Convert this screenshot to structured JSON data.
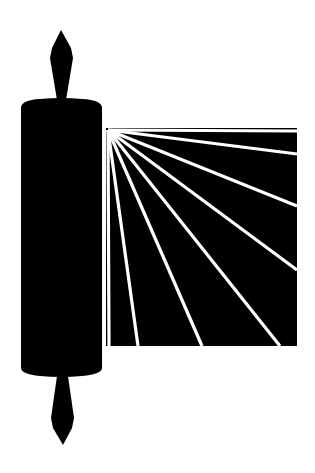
{
  "image": {
    "title": "Scroll icon",
    "subject": "scroll-with-rays",
    "background": "#ffffff",
    "foreground": "#000000",
    "ray_color": "#ffffff"
  },
  "scroll": {
    "roller": {
      "x": 21,
      "y": 100,
      "width": 81,
      "height": 275
    },
    "sheet": {
      "x": 106,
      "y": 128,
      "right": 297,
      "bottom": 346
    },
    "ray_origin": [
      108,
      130
    ],
    "ray_endpoints": [
      [
        297,
        131
      ],
      [
        297,
        154
      ],
      [
        297,
        206
      ],
      [
        297,
        270
      ],
      [
        280,
        346
      ],
      [
        202,
        346
      ],
      [
        138,
        346
      ],
      [
        109,
        346
      ]
    ]
  }
}
